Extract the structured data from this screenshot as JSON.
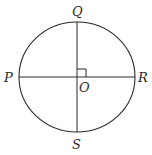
{
  "diagram": {
    "type": "circle-with-perpendicular-diameters",
    "colors": {
      "stroke": "#2a2a2a",
      "background": "#ffffff"
    },
    "circle": {
      "cx": 77,
      "cy": 77,
      "rx": 58,
      "ry": 55
    },
    "labels": {
      "top": "Q",
      "bottom": "S",
      "left": "P",
      "right": "R",
      "center": "O"
    },
    "right_angle_marker": true
  }
}
